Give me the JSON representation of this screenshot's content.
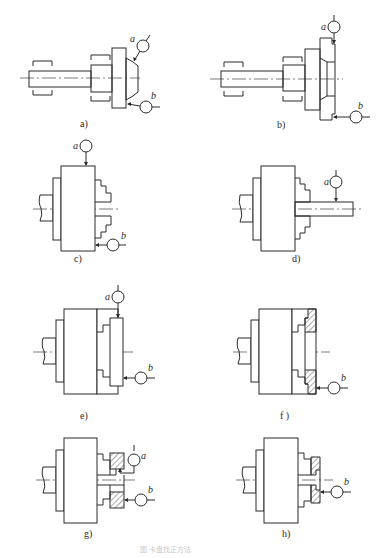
{
  "figure": {
    "caption": "图 卡盘找正方法",
    "colors": {
      "line": "#2a2a2a",
      "background": "#ffffff",
      "caption": "#c8c8c8"
    },
    "panels": [
      {
        "id": "a",
        "label": "a)",
        "indicators": [
          "a",
          "b"
        ]
      },
      {
        "id": "b",
        "label": "b)",
        "indicators": [
          "a",
          "b"
        ]
      },
      {
        "id": "c",
        "label": "c)",
        "indicators": [
          "a",
          "b"
        ]
      },
      {
        "id": "d",
        "label": "d)",
        "indicators": [
          "a"
        ]
      },
      {
        "id": "e",
        "label": "e)",
        "indicators": [
          "a",
          "b"
        ]
      },
      {
        "id": "f",
        "label": "f )",
        "indicators": [
          "b"
        ]
      },
      {
        "id": "g",
        "label": "g)",
        "indicators": [
          "a",
          "b"
        ]
      },
      {
        "id": "h",
        "label": "h)",
        "indicators": [
          "b"
        ]
      }
    ],
    "indicator_labels": {
      "a": "a",
      "b": "b"
    }
  }
}
